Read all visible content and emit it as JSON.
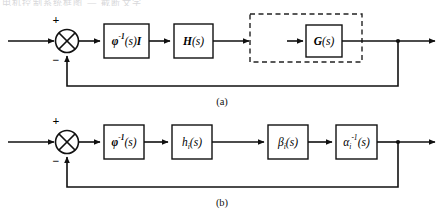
{
  "figure": {
    "top_artifact_text": "电机控制系统框图  —  截断文字",
    "background_color": "#ffffff",
    "line_color": "#111111",
    "dashed_color": "#222222"
  },
  "diagram_a": {
    "caption": "(a)",
    "input_label": "",
    "summing_junction": {
      "name": "summing-junction",
      "plus_sign": "+",
      "minus_sign": "−",
      "glyph": "circle-with-x"
    },
    "blocks": [
      {
        "id": "phi-inv-I",
        "label_html": "<tspan class=\"bi\">φ</tspan><tspan class=\"bi\" baseline-shift=\"super\" font-size=\"7.5\">-1</tspan><tspan class=\"it\">(s)</tspan><tspan class=\"bi\">I</tspan>",
        "label_text": "φ⁻¹(s)I"
      },
      {
        "id": "H-s",
        "label_html": "<tspan class=\"bi\">H</tspan><tspan class=\"it\">(s)</tspan>",
        "label_text": "H(s)"
      },
      {
        "id": "G-s",
        "label_html": "<tspan class=\"bi\">G</tspan><tspan class=\"it\">(s)</tspan>",
        "label_text": "G(s)"
      }
    ],
    "dashed_group": {
      "name": "dashed-subsystem-boundary",
      "contains": "G(s)"
    },
    "feedback": {
      "name": "feedback-path",
      "type": "unity"
    },
    "output_node": {
      "name": "output-takeoff-node"
    }
  },
  "diagram_b": {
    "caption": "(b)",
    "summing_junction": {
      "name": "summing-junction",
      "plus_sign": "+",
      "minus_sign": "−",
      "glyph": "circle-with-x"
    },
    "blocks": [
      {
        "id": "phi-inv",
        "label_html": "<tspan class=\"bi\">φ</tspan><tspan class=\"bi\" baseline-shift=\"super\" font-size=\"7.5\">-1</tspan><tspan class=\"it\">(s)</tspan>",
        "label_text": "φ⁻¹(s)"
      },
      {
        "id": "h-i",
        "label_html": "<tspan class=\"it\">h</tspan><tspan class=\"it\" baseline-shift=\"sub\" font-size=\"7.5\">i</tspan><tspan class=\"it\">(s)</tspan>",
        "label_text": "hᵢ(s)"
      },
      {
        "id": "beta-i",
        "label_html": "<tspan class=\"it\">β</tspan><tspan class=\"it\" baseline-shift=\"sub\" font-size=\"7.5\">i</tspan><tspan class=\"it\">(s)</tspan>",
        "label_text": "βᵢ(s)"
      },
      {
        "id": "alpha-i-inv",
        "label_html": "<tspan class=\"it\">α</tspan><tspan class=\"it\" baseline-shift=\"sub\" font-size=\"7.5\">i</tspan><tspan class=\"it\" baseline-shift=\"super\" font-size=\"7.5\">-1</tspan><tspan class=\"it\">(s)</tspan>",
        "label_text": "αᵢ⁻¹(s)"
      }
    ],
    "feedback": {
      "name": "feedback-path",
      "type": "unity"
    },
    "output_node": {
      "name": "output-takeoff-node"
    }
  }
}
